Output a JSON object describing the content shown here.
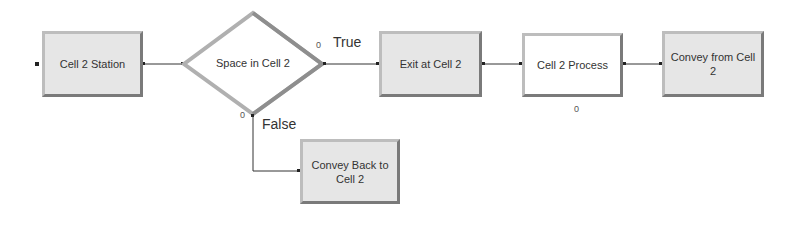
{
  "modules": {
    "station": {
      "label": "Cell 2 Station"
    },
    "decide": {
      "label": "Space in Cell 2",
      "true_count": "0",
      "false_count": "0"
    },
    "exit": {
      "label": "Exit at Cell 2"
    },
    "process": {
      "label": "Cell 2 Process",
      "count": "0"
    },
    "convey_from": {
      "label": "Convey from Cell 2"
    },
    "convey_back": {
      "label": "Convey Back to Cell 2"
    }
  },
  "branches": {
    "true_label": "True",
    "false_label": "False"
  },
  "colors": {
    "shaded_fill": "#e6e6e6",
    "border": "#9a9a9a",
    "wire": "#333333"
  }
}
